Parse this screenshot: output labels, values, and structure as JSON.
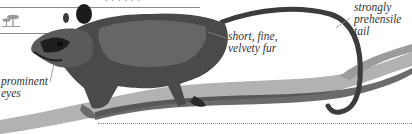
{
  "header": {
    "cropped_text": "· · · · · ·"
  },
  "icons": {
    "habitat": "trees-habitat-icon"
  },
  "annotations": [
    {
      "id": "tail",
      "text_lines": [
        "strongly",
        "prehensile",
        "tail"
      ]
    },
    {
      "id": "fur",
      "text_lines": [
        "short, fine,",
        "velvety fur"
      ]
    },
    {
      "id": "eyes",
      "text_lines": [
        "prominent",
        "eyes"
      ]
    }
  ],
  "illustration": {
    "subject": "opossum on branch",
    "palette": {
      "fur_dark": "#2b2b2b",
      "fur_mid": "#6a6a6a",
      "fur_light": "#bdbdbd",
      "branch": "#a9a9a9",
      "branch_shadow": "#3a3a3a",
      "line": "#8a8a8a"
    }
  }
}
